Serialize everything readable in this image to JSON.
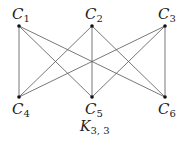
{
  "diagram": {
    "type": "complete-bipartite-graph",
    "caption": {
      "main": "K",
      "sub": "3, 3"
    },
    "nodes": [
      {
        "id": "C1",
        "letter": "C",
        "sub": "1",
        "x": 19,
        "y": 26,
        "label_pos": "above"
      },
      {
        "id": "C2",
        "letter": "C",
        "sub": "2",
        "x": 92,
        "y": 26,
        "label_pos": "above"
      },
      {
        "id": "C3",
        "letter": "C",
        "sub": "3",
        "x": 165,
        "y": 26,
        "label_pos": "above"
      },
      {
        "id": "C4",
        "letter": "C",
        "sub": "4",
        "x": 19,
        "y": 97,
        "label_pos": "below"
      },
      {
        "id": "C5",
        "letter": "C",
        "sub": "5",
        "x": 92,
        "y": 97,
        "label_pos": "below"
      },
      {
        "id": "C6",
        "letter": "C",
        "sub": "6",
        "x": 165,
        "y": 97,
        "label_pos": "below"
      }
    ],
    "edges": [
      [
        "C1",
        "C4"
      ],
      [
        "C1",
        "C5"
      ],
      [
        "C1",
        "C6"
      ],
      [
        "C2",
        "C4"
      ],
      [
        "C2",
        "C5"
      ],
      [
        "C2",
        "C6"
      ],
      [
        "C3",
        "C4"
      ],
      [
        "C3",
        "C5"
      ],
      [
        "C3",
        "C6"
      ]
    ]
  }
}
